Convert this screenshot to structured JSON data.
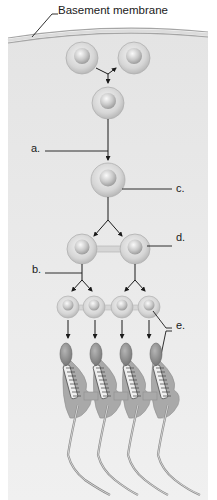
{
  "diagram": {
    "labels": {
      "basement_membrane": "Basement membrane",
      "a": "a.",
      "b": "b.",
      "c": "c.",
      "d": "d.",
      "e": "e."
    },
    "stages": [
      {
        "row": 1,
        "cells": 2,
        "description": "cells at basement membrane (mitotic division)"
      },
      {
        "row": 2,
        "cells": 1
      },
      {
        "row": 3,
        "cells": 1,
        "label": "c."
      },
      {
        "row": 4,
        "cells": 2,
        "label": "d."
      },
      {
        "row": 5,
        "cells": 4,
        "label": "e."
      },
      {
        "row": 6,
        "cells": 4,
        "description": "maturing sperm with flagella",
        "label": "e."
      }
    ],
    "pointer_labels": [
      "a.",
      "b.",
      "c.",
      "d.",
      "e."
    ],
    "colors": {
      "tissue": "#ececec",
      "membrane": "#9a9a9a",
      "cell_outer": "#d0d0d0",
      "cell_nucleus": "#bfbfbf",
      "sperm_head": "#8c8c8c",
      "cytoplasm": "#a8a8a8",
      "line": "#1a1a1a"
    }
  }
}
